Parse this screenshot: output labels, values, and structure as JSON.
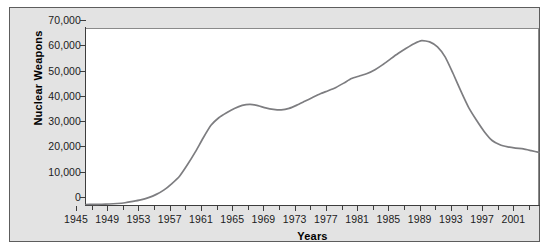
{
  "chart_data": {
    "type": "line",
    "title": "",
    "xlabel": "Years",
    "ylabel": "Nuclear Weapons",
    "xlim": [
      1945,
      2003
    ],
    "ylim": [
      0,
      70000
    ],
    "grid": false,
    "legend": false,
    "series_color": "#7d7d80",
    "x_tick_labels": [
      "1945",
      "1949",
      "1953",
      "1957",
      "1961",
      "1965",
      "1969",
      "1973",
      "1977",
      "1981",
      "1985",
      "1989",
      "1993",
      "1997",
      "2001"
    ],
    "x_tick_values": [
      1945,
      1949,
      1953,
      1957,
      1961,
      1965,
      1969,
      1973,
      1977,
      1981,
      1985,
      1989,
      1993,
      1997,
      2001
    ],
    "y_tick_labels": [
      "0",
      "10,000",
      "20,000",
      "30,000",
      "40,000",
      "50,000",
      "60,000",
      "70,000"
    ],
    "y_tick_values": [
      0,
      10000,
      20000,
      30000,
      40000,
      50000,
      60000,
      70000
    ],
    "series": [
      {
        "name": "Nuclear Weapons",
        "x": [
          1945,
          1946,
          1947,
          1948,
          1949,
          1950,
          1951,
          1952,
          1953,
          1954,
          1955,
          1956,
          1957,
          1958,
          1959,
          1960,
          1961,
          1962,
          1963,
          1964,
          1965,
          1966,
          1967,
          1968,
          1969,
          1970,
          1971,
          1972,
          1973,
          1974,
          1975,
          1976,
          1977,
          1978,
          1979,
          1980,
          1981,
          1982,
          1983,
          1984,
          1985,
          1986,
          1987,
          1988,
          1989,
          1990,
          1991,
          1992,
          1993,
          1994,
          1995,
          1996,
          1997,
          1998,
          1999,
          2000,
          2001,
          2002,
          2003
        ],
        "values": [
          200,
          250,
          300,
          400,
          600,
          900,
          1400,
          2000,
          2900,
          4200,
          6000,
          8500,
          11500,
          16000,
          21000,
          26500,
          31500,
          34500,
          36500,
          38200,
          39400,
          39800,
          39300,
          38400,
          37800,
          37600,
          38200,
          39500,
          41000,
          42500,
          44000,
          45200,
          46500,
          48200,
          50000,
          51000,
          52000,
          53500,
          55500,
          57800,
          60000,
          62000,
          63800,
          65000,
          64500,
          62500,
          58500,
          52000,
          45000,
          38500,
          33500,
          29000,
          25500,
          23800,
          23000,
          22500,
          22200,
          21500,
          20800
        ]
      }
    ]
  },
  "axis_titles": {
    "x": "Years",
    "y": "Nuclear Weapons"
  }
}
